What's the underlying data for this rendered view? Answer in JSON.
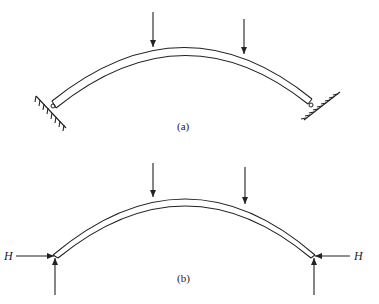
{
  "figure": {
    "panels": [
      {
        "id": "a",
        "label": "(a)",
        "description": "Curved arch with two downward point loads, pinned at both ends to inclined hatched supports"
      },
      {
        "id": "b",
        "label": "(b)",
        "description": "Free-body diagram of arch with two downward loads, horizontal thrust H and vertical reactions at each support",
        "left_force_label": "H",
        "right_force_label": "H"
      }
    ],
    "colors": {
      "line": "#222222",
      "background": "#ffffff"
    }
  }
}
